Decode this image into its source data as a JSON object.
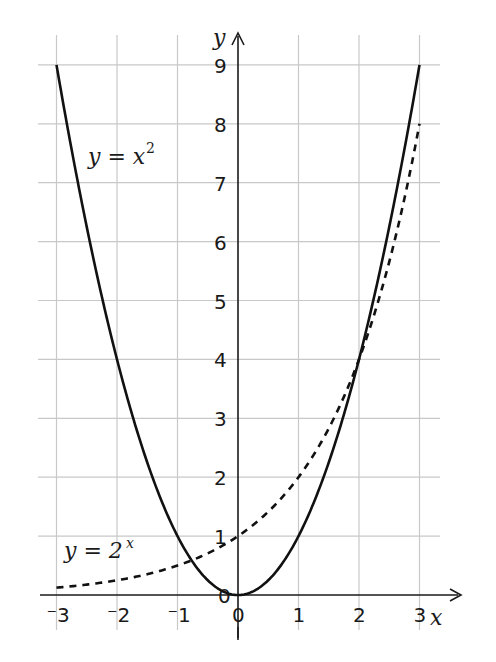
{
  "chart_data": {
    "type": "line",
    "title": "",
    "xlabel": "x",
    "ylabel": "y",
    "xlim": [
      -3,
      3
    ],
    "ylim": [
      0,
      9
    ],
    "grid": true,
    "x_ticks": [
      "-3",
      "-2",
      "-1",
      "0",
      "1",
      "2",
      "3"
    ],
    "y_ticks": [
      "0",
      "1",
      "2",
      "3",
      "4",
      "5",
      "6",
      "7",
      "8",
      "9"
    ],
    "series": [
      {
        "name": "y = x^2",
        "style": "solid",
        "x": [
          -3,
          -2,
          -1,
          0,
          1,
          2,
          3
        ],
        "values": [
          9,
          4,
          1,
          0,
          1,
          4,
          9
        ]
      },
      {
        "name": "y = 2^x",
        "style": "dashed",
        "x": [
          -3,
          -2,
          -1,
          0,
          1,
          2,
          3
        ],
        "values": [
          0.125,
          0.25,
          0.5,
          1,
          2,
          4,
          8
        ]
      }
    ],
    "annotations": [
      {
        "text": "y = x²",
        "position": "upper-left near curve"
      },
      {
        "text": "y = 2ˣ",
        "position": "lower-left near dashed curve"
      }
    ]
  },
  "labels": {
    "x_axis": "x",
    "y_axis": "y",
    "curve1_lhs": "y = x",
    "curve1_exp": "2",
    "curve2_lhs": "y = 2",
    "curve2_exp": "x"
  },
  "colors": {
    "grid": "#c8c8c8",
    "axis": "#1a1a1a",
    "curve": "#111111"
  }
}
